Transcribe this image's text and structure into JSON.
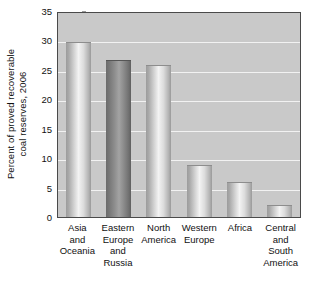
{
  "chart_data": {
    "type": "bar",
    "title": "",
    "xlabel": "",
    "ylabel": "Percent of proved recoverable\ncoal reserves, 2006",
    "categories": [
      "Asia\nand\nOceania",
      "Eastern\nEurope\nand\nRussia",
      "North\nAmerica",
      "Western\nEurope",
      "Africa",
      "Central\nand\nSouth\nAmerica"
    ],
    "values": [
      30,
      27,
      26,
      9,
      6,
      2
    ],
    "ylim": [
      0,
      35
    ],
    "ytick_labels": [
      "0",
      "5",
      "10",
      "15",
      "20",
      "25",
      "30",
      "35"
    ],
    "ytick_values": [
      0,
      5,
      10,
      15,
      20,
      25,
      30,
      35
    ],
    "grid": true,
    "legend": "none",
    "colors": {
      "plot_background": "#c9c9c9",
      "gridline": "#f2f2f2",
      "axis": "#4a4a4a",
      "bar_light": "#d2d2d2",
      "bar_dark": "#6b6b6b",
      "page_background": "#ffffff",
      "text": "#111111"
    },
    "bar_shading": [
      "light",
      "dark",
      "light",
      "light",
      "light",
      "light"
    ]
  }
}
